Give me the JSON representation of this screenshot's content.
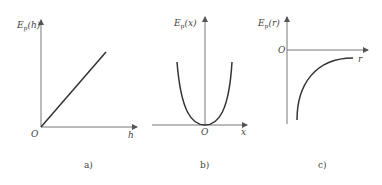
{
  "figure": {
    "panels": [
      {
        "id": "a",
        "caption": "a)",
        "ylabel_main": "E",
        "ylabel_sub": "p",
        "ylabel_arg": "(h)",
        "xlabel": "h",
        "origin_label": "O",
        "curve_type": "linear increasing from origin"
      },
      {
        "id": "b",
        "caption": "b)",
        "ylabel_main": "E",
        "ylabel_sub": "p",
        "ylabel_arg": "(x)",
        "xlabel": "x",
        "origin_label": "O",
        "curve_type": "parabola with minimum at origin"
      },
      {
        "id": "c",
        "caption": "c)",
        "ylabel_main": "E",
        "ylabel_sub": "p",
        "ylabel_arg": "(r)",
        "xlabel": "r",
        "origin_label": "O",
        "curve_type": "negative, increasing toward zero asymptotically"
      }
    ]
  },
  "colors": {
    "axis": "#777777",
    "curve": "#333333",
    "text": "#444444",
    "background": "#ffffff"
  }
}
